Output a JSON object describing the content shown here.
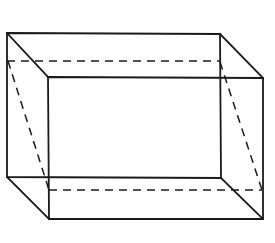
{
  "diagram": {
    "type": "wireframe-cuboid",
    "colors": {
      "background": "#ffffff",
      "stroke": "#1a1a1a"
    },
    "back_face": {
      "tl": [
        7,
        33
      ],
      "tr": [
        220,
        34
      ],
      "br": [
        221,
        178
      ],
      "bl": [
        7,
        177
      ]
    },
    "front_face": {
      "tl": [
        48,
        77
      ],
      "tr": [
        263,
        78
      ],
      "br": [
        263,
        219
      ],
      "bl": [
        49,
        219
      ]
    },
    "hidden_edges": [
      {
        "from": [
          7,
          61
        ],
        "to": [
          220,
          61
        ]
      },
      {
        "from": [
          8,
          61
        ],
        "to": [
          49,
          190
        ]
      },
      {
        "from": [
          220,
          62
        ],
        "to": [
          262,
          190
        ]
      },
      {
        "from": [
          49,
          190
        ],
        "to": [
          262,
          190
        ]
      }
    ]
  }
}
